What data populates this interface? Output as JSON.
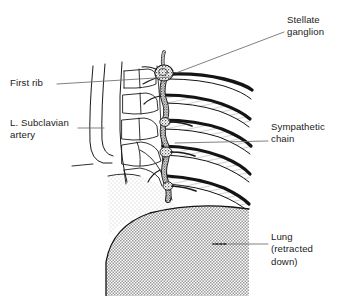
{
  "figure": {
    "kind": "anatomical-line-drawing",
    "background_color": "#ffffff",
    "ink_color": "#1a1a1a",
    "lung_fill_color": "#c8c8c8",
    "tissue_fill_color": "#ebebeb"
  },
  "labels": {
    "stellate_ganglion": {
      "line1": "Stellate",
      "line2": "ganglion"
    },
    "first_rib": {
      "line1": "First rib"
    },
    "subclavian_artery": {
      "line1": "L. Subclavian",
      "line2": "artery"
    },
    "sympathetic_chain": {
      "line1": "Sympathetic",
      "line2": "chain"
    },
    "lung": {
      "line1": "Lung",
      "line2": "(retracted",
      "line3": "down)"
    }
  },
  "structures": [
    {
      "name": "stellate-ganglion",
      "style": "stippled-oval"
    },
    {
      "name": "sympathetic-chain",
      "style": "dark-irregular-cord"
    },
    {
      "name": "ribs",
      "count": 5,
      "style": "dark-upper-border-hatched-body"
    },
    {
      "name": "vertebral-bodies",
      "count": 5,
      "style": "outline-blocks"
    },
    {
      "name": "subclavian-artery",
      "style": "outlined-tube"
    },
    {
      "name": "lung",
      "style": "gray-stippled-dome"
    }
  ]
}
